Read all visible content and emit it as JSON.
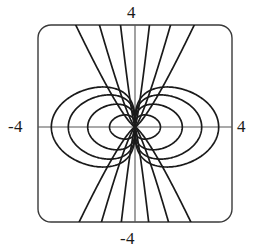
{
  "figure": {
    "kind": "orthogonal-curve-net-plot",
    "background_color": "#ffffff",
    "curve_color": "#1a1a1a",
    "axis_color": "#4a4a4a",
    "frame_color": "#3a3a3a"
  },
  "labels": {
    "top": "4",
    "bottom": "-4",
    "left": "-4",
    "right": "4"
  },
  "chart_data": {
    "type": "line",
    "title": "",
    "xlabel": "",
    "ylabel": "",
    "xlim": [
      -4,
      4
    ],
    "ylim": [
      -4,
      4
    ],
    "grid": false,
    "legend": null,
    "axes": {
      "x_ticks": [
        -4,
        4
      ],
      "x_tick_labels": [
        "-4",
        "4"
      ],
      "y_ticks": [
        -4,
        4
      ],
      "y_tick_labels": [
        "-4",
        "4"
      ],
      "x_axis_y": 0,
      "y_axis_x": 0,
      "frame": "rounded-rectangle",
      "frame_x": [
        -4,
        4
      ],
      "frame_y": [
        -4,
        4
      ]
    },
    "singular_point": {
      "x": 0,
      "y": 0,
      "note": "all curves converge at origin"
    },
    "series": [
      {
        "name": "oval-family-left-1",
        "family": "ovals",
        "side": "left",
        "x_extent": [
          -1.05,
          0
        ],
        "y_extent": [
          -0.52,
          0.52
        ]
      },
      {
        "name": "oval-family-left-2",
        "family": "ovals",
        "side": "left",
        "x_extent": [
          -1.95,
          0
        ],
        "y_extent": [
          -0.98,
          0.98
        ]
      },
      {
        "name": "oval-family-left-3",
        "family": "ovals",
        "side": "left",
        "x_extent": [
          -2.75,
          0
        ],
        "y_extent": [
          -1.38,
          1.38
        ]
      },
      {
        "name": "oval-family-left-4",
        "family": "ovals",
        "side": "left",
        "x_extent": [
          -3.45,
          0
        ],
        "y_extent": [
          -1.72,
          1.72
        ]
      },
      {
        "name": "oval-family-right-1",
        "family": "ovals",
        "side": "right",
        "x_extent": [
          0,
          1.05
        ],
        "y_extent": [
          -0.52,
          0.52
        ]
      },
      {
        "name": "oval-family-right-2",
        "family": "ovals",
        "side": "right",
        "x_extent": [
          0,
          1.95
        ],
        "y_extent": [
          -0.98,
          0.98
        ]
      },
      {
        "name": "oval-family-right-3",
        "family": "ovals",
        "side": "right",
        "x_extent": [
          0,
          2.75
        ],
        "y_extent": [
          -1.38,
          1.38
        ]
      },
      {
        "name": "oval-family-right-4",
        "family": "ovals",
        "side": "right",
        "x_extent": [
          0,
          3.45
        ],
        "y_extent": [
          -1.72,
          1.72
        ]
      },
      {
        "name": "hyperbola-family-left-1",
        "family": "hyperbolas",
        "side": "left",
        "top_crossing_x": -0.55,
        "bottom_crossing_x": -0.55
      },
      {
        "name": "hyperbola-family-left-2",
        "family": "hyperbolas",
        "side": "left",
        "top_crossing_x": -1.35,
        "bottom_crossing_x": -1.35
      },
      {
        "name": "hyperbola-family-left-3",
        "family": "hyperbolas",
        "side": "left",
        "top_crossing_x": -2.25,
        "bottom_crossing_x": -2.25
      },
      {
        "name": "hyperbola-family-right-1",
        "family": "hyperbolas",
        "side": "right",
        "top_crossing_x": 0.55,
        "bottom_crossing_x": 0.55
      },
      {
        "name": "hyperbola-family-right-2",
        "family": "hyperbolas",
        "side": "right",
        "top_crossing_x": 1.35,
        "bottom_crossing_x": 1.35
      },
      {
        "name": "hyperbola-family-right-3",
        "family": "hyperbolas",
        "side": "right",
        "top_crossing_x": 2.25,
        "bottom_crossing_x": 2.25
      }
    ]
  }
}
